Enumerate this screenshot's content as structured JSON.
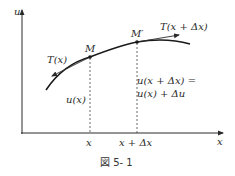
{
  "figure": {
    "caption": "図 5- 1",
    "axes": {
      "y_label": "u",
      "x_label": "x"
    },
    "points": {
      "m": "M",
      "m_prime": "M′"
    },
    "tangents": {
      "left": "T(x)",
      "right": "T(x + Δx)"
    },
    "annotations": {
      "u_of_x": "u(x)",
      "u_shift_line1": "u(x + Δx) =",
      "u_shift_line2": "u(x) + Δu"
    },
    "ticks": {
      "x": "x",
      "x_plus_dx": "x + Δx"
    },
    "colors": {
      "ink": "#2a2a2a",
      "background": "#ffffff"
    }
  }
}
